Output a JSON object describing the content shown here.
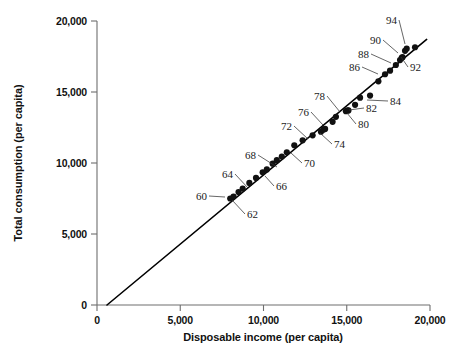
{
  "chart_data": {
    "type": "scatter",
    "title": "",
    "xlabel": "Disposable income (per capita)",
    "ylabel": "Total consumption (per capita)",
    "xlim": [
      0,
      20000
    ],
    "ylim": [
      0,
      20000
    ],
    "grid": false,
    "legend": "none",
    "xticks": [
      0,
      5000,
      10000,
      15000,
      20000
    ],
    "yticks": [
      0,
      5000,
      10000,
      15000,
      20000
    ],
    "xticklabels": [
      "0",
      "5,000",
      "10,000",
      "15,000",
      "20,000"
    ],
    "yticklabels": [
      "0",
      "5,000",
      "10,000",
      "15,000",
      "20,000"
    ],
    "point_label_name": "year",
    "labeled_points": [
      "60",
      "62",
      "64",
      "66",
      "68",
      "70",
      "72",
      "74",
      "76",
      "78",
      "80",
      "82",
      "84",
      "86",
      "88",
      "90",
      "92",
      "94"
    ],
    "points": [
      {
        "label": "60",
        "x": 8000,
        "y": 7500
      },
      {
        "label": "61",
        "x": 8200,
        "y": 7640
      },
      {
        "label": "62",
        "x": 8500,
        "y": 7950
      },
      {
        "label": "63",
        "x": 8750,
        "y": 8200
      },
      {
        "label": "64",
        "x": 9150,
        "y": 8600
      },
      {
        "label": "65",
        "x": 9550,
        "y": 8950
      },
      {
        "label": "66",
        "x": 9950,
        "y": 9350
      },
      {
        "label": "67",
        "x": 10200,
        "y": 9550
      },
      {
        "label": "68",
        "x": 10550,
        "y": 9950
      },
      {
        "label": "69",
        "x": 10800,
        "y": 10200
      },
      {
        "label": "70",
        "x": 11100,
        "y": 10450
      },
      {
        "label": "71",
        "x": 11400,
        "y": 10750
      },
      {
        "label": "72",
        "x": 11850,
        "y": 11250
      },
      {
        "label": "73",
        "x": 12350,
        "y": 11600
      },
      {
        "label": "74",
        "x": 12950,
        "y": 11950
      },
      {
        "label": "75",
        "x": 13450,
        "y": 12200
      },
      {
        "label": "76",
        "x": 13600,
        "y": 12350
      },
      {
        "label": "77",
        "x": 13700,
        "y": 12400
      },
      {
        "label": "78",
        "x": 14150,
        "y": 12900
      },
      {
        "label": "79",
        "x": 14350,
        "y": 13250
      },
      {
        "label": "80",
        "x": 14950,
        "y": 13650
      },
      {
        "label": "81",
        "x": 15050,
        "y": 13700
      },
      {
        "label": "82",
        "x": 15100,
        "y": 13700
      },
      {
        "label": "83",
        "x": 15500,
        "y": 14100
      },
      {
        "label": "84",
        "x": 16400,
        "y": 14750
      },
      {
        "label": "85",
        "x": 15800,
        "y": 14600
      },
      {
        "label": "86",
        "x": 16900,
        "y": 15750
      },
      {
        "label": "87",
        "x": 17300,
        "y": 16250
      },
      {
        "label": "88",
        "x": 17600,
        "y": 16500
      },
      {
        "label": "89",
        "x": 17950,
        "y": 16900
      },
      {
        "label": "90",
        "x": 18200,
        "y": 17250
      },
      {
        "label": "91",
        "x": 18300,
        "y": 17400
      },
      {
        "label": "92",
        "x": 18350,
        "y": 17450
      },
      {
        "label": "93",
        "x": 18500,
        "y": 17900
      },
      {
        "label": "94",
        "x": 18600,
        "y": 18050
      },
      {
        "label": "95",
        "x": 19100,
        "y": 18150
      }
    ],
    "fit_line": {
      "type": "linear-regression",
      "x_start": 600,
      "y_start": 0,
      "x_end": 19800,
      "y_end": 18700
    },
    "annotations": [
      {
        "label": "60",
        "text_x": 196,
        "text_y": 200,
        "point_x": 225,
        "point_y": 197
      },
      {
        "label": "62",
        "text_x": 247,
        "text_y": 218,
        "point_x": 232,
        "point_y": 200
      },
      {
        "label": "64",
        "text_x": 222,
        "text_y": 178,
        "point_x": 248,
        "point_y": 188
      },
      {
        "label": "66",
        "text_x": 276,
        "text_y": 190,
        "point_x": 265,
        "point_y": 176
      },
      {
        "label": "68",
        "text_x": 245,
        "text_y": 159,
        "point_x": 277,
        "point_y": 167
      },
      {
        "label": "70",
        "text_x": 304,
        "text_y": 167,
        "point_x": 291,
        "point_y": 153
      },
      {
        "label": "72",
        "text_x": 281,
        "text_y": 130,
        "point_x": 308,
        "point_y": 139
      },
      {
        "label": "74",
        "text_x": 334,
        "text_y": 148,
        "point_x": 320,
        "point_y": 133
      },
      {
        "label": "76",
        "text_x": 298,
        "text_y": 116,
        "point_x": 323,
        "point_y": 125
      },
      {
        "label": "78",
        "text_x": 314,
        "text_y": 100,
        "point_x": 340,
        "point_y": 112
      },
      {
        "label": "80",
        "text_x": 358,
        "text_y": 128,
        "point_x": 347,
        "point_y": 113
      },
      {
        "label": "82",
        "text_x": 366,
        "text_y": 112,
        "point_x": 349,
        "point_y": 110
      },
      {
        "label": "84",
        "text_x": 390,
        "text_y": 105,
        "point_x": 367,
        "point_y": 100
      },
      {
        "label": "86",
        "text_x": 349,
        "text_y": 71,
        "point_x": 378,
        "point_y": 74
      },
      {
        "label": "88",
        "text_x": 358,
        "text_y": 58,
        "point_x": 391,
        "point_y": 63
      },
      {
        "label": "90",
        "text_x": 370,
        "text_y": 44,
        "point_x": 398,
        "point_y": 53
      },
      {
        "label": "92",
        "text_x": 410,
        "text_y": 71,
        "point_x": 401,
        "point_y": 57
      },
      {
        "label": "94",
        "text_x": 386,
        "text_y": 24,
        "point_x": 405,
        "point_y": 44
      }
    ]
  }
}
